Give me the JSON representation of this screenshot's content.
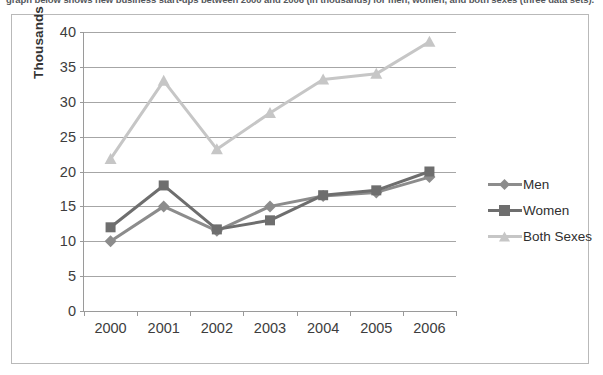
{
  "caption": {
    "text": "graph below shows new business start-ups between 2000 and 2006 (in thousands) for men, women, and both sexes (three data sets)."
  },
  "chart_data": {
    "type": "line",
    "title": "",
    "xlabel": "",
    "ylabel": "Thousands",
    "categories": [
      "2000",
      "2001",
      "2002",
      "2003",
      "2004",
      "2005",
      "2006"
    ],
    "ylim": [
      0,
      40
    ],
    "yticks": [
      "0",
      "5",
      "10",
      "15",
      "20",
      "25",
      "30",
      "35",
      "40"
    ],
    "grid": true,
    "legend_position": "right",
    "series": [
      {
        "name": "Men",
        "color": "#8c8c8c",
        "marker": "diamond",
        "values": [
          10,
          15,
          11.5,
          15,
          16.5,
          17,
          19.2
        ]
      },
      {
        "name": "Women",
        "color": "#6e6e6e",
        "marker": "square",
        "values": [
          12,
          18,
          11.7,
          13,
          16.6,
          17.3,
          20
        ]
      },
      {
        "name": "Both Sexes",
        "color": "#c6c6c6",
        "marker": "triangle",
        "values": [
          21.8,
          33,
          23.2,
          28.4,
          33.2,
          34,
          38.6
        ]
      }
    ]
  },
  "legend": {
    "items": [
      {
        "label": "Men"
      },
      {
        "label": "Women"
      },
      {
        "label": "Both Sexes"
      }
    ]
  },
  "colors": {
    "grid": "#a6a6a6",
    "axis": "#9a9a9a",
    "frame": "#b9b9b9",
    "text": "#3d3d3d"
  }
}
